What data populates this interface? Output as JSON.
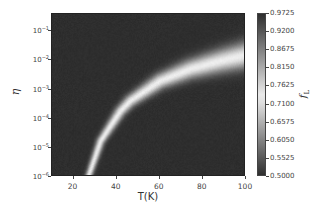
{
  "chart_data": {
    "type": "heatmap",
    "title": "",
    "xlabel": "T(K)",
    "ylabel": "η",
    "colorbar_label": "f_L",
    "colorbar_label_main": "f",
    "colorbar_label_sub": "L",
    "xlim": [
      10,
      100
    ],
    "ylim_log10": [
      -6,
      -0.41
    ],
    "yscale": "log",
    "x_ticks": [
      20,
      40,
      60,
      80,
      100
    ],
    "y_ticks": [
      {
        "base": "10",
        "exp": "-1",
        "value": 0.1
      },
      {
        "base": "10",
        "exp": "-2",
        "value": 0.01
      },
      {
        "base": "10",
        "exp": "-3",
        "value": 0.001
      },
      {
        "base": "10",
        "exp": "-4",
        "value": 0.0001
      },
      {
        "base": "10",
        "exp": "-5",
        "value": 1e-05
      },
      {
        "base": "10",
        "exp": "-6",
        "value": 1e-06
      }
    ],
    "colorbar_ticks": [
      "0.9725",
      "0.9200",
      "0.8675",
      "0.8150",
      "0.7625",
      "0.7100",
      "0.6575",
      "0.6050",
      "0.5525",
      "0.5000"
    ],
    "colorbar_range": [
      0.5,
      0.9725
    ],
    "colormap": "diverging gray: dark at both ends, bright near 0.73",
    "background_value": 0.5,
    "ridge_peak_value": 0.73,
    "ridge": {
      "description": "bright band where f_L peaks, curving from low T/low η to high T/high η",
      "T": [
        27,
        32.6,
        41.9,
        46.5,
        60.5,
        74.4,
        88.4,
        100
      ],
      "log10_eta": [
        -6.0,
        -4.8,
        -3.76,
        -3.41,
        -2.72,
        -2.31,
        -2.03,
        -1.83
      ]
    },
    "grid": false,
    "legend": "colorbar right"
  },
  "axes": {
    "x_tick_labels": [
      "20",
      "40",
      "60",
      "80",
      "100"
    ],
    "x_label": "T(K)",
    "y_label": "η"
  },
  "colorbar": {
    "labels": [
      "0.9725",
      "0.9200",
      "0.8675",
      "0.8150",
      "0.7625",
      "0.7100",
      "0.6575",
      "0.6050",
      "0.5525",
      "0.5000"
    ]
  }
}
